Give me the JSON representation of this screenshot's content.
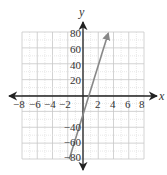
{
  "chart_data": {
    "type": "line",
    "title": "",
    "xlabel": "x",
    "ylabel": "y",
    "xlim": [
      -8,
      8
    ],
    "ylim": [
      -80,
      80
    ],
    "grid": true,
    "x_ticks": [
      "-8",
      "-6",
      "-4",
      "-2",
      "2",
      "4",
      "6",
      "8"
    ],
    "y_ticks": [
      "80",
      "60",
      "40",
      "20",
      "-40",
      "-60",
      "-80"
    ],
    "series": [
      {
        "name": "line",
        "color": "#888888",
        "points": [
          [
            -1.8,
            -80
          ],
          [
            3.3,
            78
          ]
        ],
        "arrow_at_end": true
      }
    ]
  },
  "labels": {
    "x_axis": "x",
    "y_axis": "y",
    "x_ticks": {
      "n8": "−8",
      "n6": "−6",
      "n4": "−4",
      "n2": "−2",
      "p2": "2",
      "p4": "4",
      "p6": "6",
      "p8": "8"
    },
    "y_ticks": {
      "p80": "80",
      "p60": "60",
      "p40": "40",
      "p20": "20",
      "n40": "−40",
      "n60": "−60",
      "n80": "−80"
    }
  },
  "colors": {
    "axis": "#222222",
    "grid_major": "#c8c8c8",
    "grid_minor": "#e2e2e2",
    "line": "#888888",
    "text": "#333333"
  }
}
